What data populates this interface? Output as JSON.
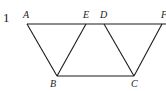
{
  "problem": {
    "number": "1"
  },
  "diagram": {
    "labels": {
      "A": "A",
      "E": "E",
      "D": "D",
      "F": "F",
      "B": "B",
      "C": "C"
    },
    "points": {
      "A": [
        27,
        24
      ],
      "E": [
        86,
        24
      ],
      "D": [
        104,
        24
      ],
      "F": [
        162,
        24
      ],
      "B": [
        57,
        76
      ],
      "C": [
        134,
        76
      ]
    },
    "segments": [
      [
        "A",
        "F"
      ],
      [
        "B",
        "C"
      ],
      [
        "A",
        "B"
      ],
      [
        "E",
        "B"
      ],
      [
        "D",
        "C"
      ],
      [
        "F",
        "C"
      ]
    ],
    "stroke_color": "#1a1a1a"
  }
}
